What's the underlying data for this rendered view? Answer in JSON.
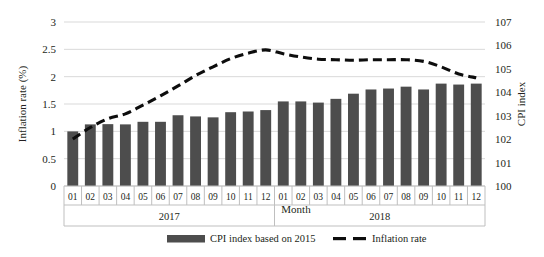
{
  "chart_data": {
    "type": "bar",
    "title": "",
    "subtitle": "",
    "xlabel": "Month",
    "grid": true,
    "legend_position": "bottom",
    "categories": [
      "01",
      "02",
      "03",
      "04",
      "05",
      "06",
      "07",
      "08",
      "09",
      "10",
      "11",
      "12",
      "01",
      "02",
      "03",
      "04",
      "05",
      "06",
      "07",
      "08",
      "09",
      "10",
      "11",
      "12"
    ],
    "group_labels": [
      "2017",
      "2018"
    ],
    "axes": {
      "left": {
        "label": "Inflation rate (%)",
        "ticks": [
          "0",
          "0.5",
          "1",
          "1.5",
          "2",
          "2.5",
          "3"
        ],
        "tick_values": [
          0,
          0.5,
          1,
          1.5,
          2,
          2.5,
          3
        ],
        "ylim": [
          0,
          3
        ]
      },
      "right": {
        "label": "CPI index",
        "ticks": [
          "100",
          "101",
          "102",
          "103",
          "104",
          "105",
          "106",
          "107"
        ],
        "tick_values": [
          100,
          101,
          102,
          103,
          104,
          105,
          106,
          107
        ],
        "ylim": [
          100,
          107
        ]
      }
    },
    "series": [
      {
        "name": "CPI index based on 2015",
        "type": "bar",
        "axis": "right",
        "color": "#4d4d4d",
        "values": [
          102.33,
          102.63,
          102.64,
          102.63,
          102.74,
          102.74,
          103.02,
          102.97,
          102.93,
          103.15,
          103.18,
          103.24,
          103.61,
          103.61,
          103.56,
          103.72,
          103.94,
          104.12,
          104.16,
          104.24,
          104.12,
          104.37,
          104.33,
          104.37
        ]
      },
      {
        "name": "Inflation rate",
        "type": "line",
        "axis": "left",
        "color": "#0d0d0d",
        "style": "dashed",
        "values": [
          0.86,
          1.07,
          1.23,
          1.32,
          1.48,
          1.65,
          1.83,
          2.02,
          2.18,
          2.33,
          2.43,
          2.49,
          2.42,
          2.36,
          2.32,
          2.31,
          2.3,
          2.31,
          2.31,
          2.31,
          2.28,
          2.18,
          2.05,
          1.98
        ]
      }
    ]
  },
  "legend": {
    "items": [
      {
        "label": "CPI index based on 2015",
        "marker": "bar-swatch"
      },
      {
        "label": "Inflation rate",
        "marker": "dashed-line-swatch"
      }
    ]
  },
  "colors": {
    "bar": "#4d4d4d",
    "line": "#0d0d0d",
    "grid": "#d9d9d9",
    "frame": "#bfbfbf",
    "text": "#231f20",
    "background": "#ffffff"
  }
}
